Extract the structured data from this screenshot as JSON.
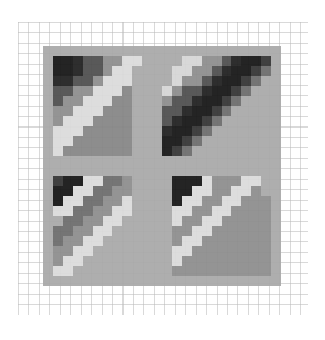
{
  "figure": {
    "kind": "heatmap-image",
    "background_color": "#ffffff",
    "grid_color": "#969696",
    "grid_cell_px": 10.45,
    "grid_rect": {
      "x": 18,
      "y": 22,
      "w": 290,
      "h": 293
    },
    "panel_rect": {
      "x": 43,
      "y": 46,
      "w": 238,
      "h": 240
    },
    "alpha": 0.93
  },
  "chart_data": {
    "type": "heatmap",
    "title": "",
    "xlabel": "",
    "ylabel": "",
    "colormap": "gray",
    "vmin": 0,
    "vmax": 1,
    "grid": true,
    "legend": "none",
    "nrows": 24,
    "ncols": 24,
    "xticklabels": [],
    "yticklabels": [],
    "values": [
      [
        0.66,
        0.66,
        0.66,
        0.66,
        0.66,
        0.66,
        0.66,
        0.66,
        0.66,
        0.66,
        0.66,
        0.66,
        0.66,
        0.66,
        0.66,
        0.66,
        0.66,
        0.66,
        0.66,
        0.66,
        0.66,
        0.66,
        0.66,
        0.66
      ],
      [
        0.66,
        0.08,
        0.08,
        0.12,
        0.3,
        0.3,
        0.55,
        0.55,
        0.86,
        0.86,
        0.66,
        0.66,
        0.66,
        0.66,
        0.84,
        0.84,
        0.55,
        0.55,
        0.3,
        0.12,
        0.08,
        0.08,
        0.2,
        0.66
      ],
      [
        0.66,
        0.08,
        0.08,
        0.12,
        0.3,
        0.3,
        0.55,
        0.86,
        0.86,
        0.66,
        0.66,
        0.66,
        0.66,
        0.84,
        0.84,
        0.55,
        0.55,
        0.3,
        0.12,
        0.08,
        0.08,
        0.2,
        0.42,
        0.66
      ],
      [
        0.66,
        0.12,
        0.12,
        0.3,
        0.3,
        0.55,
        0.86,
        0.86,
        0.86,
        0.66,
        0.66,
        0.66,
        0.66,
        0.84,
        0.55,
        0.55,
        0.3,
        0.12,
        0.08,
        0.08,
        0.2,
        0.42,
        0.66,
        0.66
      ],
      [
        0.66,
        0.3,
        0.3,
        0.55,
        0.55,
        0.86,
        0.86,
        0.86,
        0.52,
        0.66,
        0.66,
        0.66,
        0.84,
        0.55,
        0.3,
        0.3,
        0.12,
        0.08,
        0.08,
        0.2,
        0.42,
        0.66,
        0.66,
        0.66
      ],
      [
        0.66,
        0.3,
        0.55,
        0.55,
        0.86,
        0.86,
        0.86,
        0.52,
        0.52,
        0.66,
        0.66,
        0.66,
        0.55,
        0.3,
        0.3,
        0.12,
        0.08,
        0.08,
        0.2,
        0.42,
        0.66,
        0.66,
        0.66,
        0.66
      ],
      [
        0.66,
        0.55,
        0.55,
        0.86,
        0.86,
        0.86,
        0.52,
        0.52,
        0.52,
        0.66,
        0.66,
        0.66,
        0.3,
        0.3,
        0.12,
        0.08,
        0.08,
        0.2,
        0.42,
        0.66,
        0.66,
        0.66,
        0.66,
        0.66
      ],
      [
        0.66,
        0.55,
        0.86,
        0.86,
        0.86,
        0.52,
        0.52,
        0.52,
        0.52,
        0.66,
        0.66,
        0.66,
        0.3,
        0.12,
        0.08,
        0.08,
        0.2,
        0.42,
        0.66,
        0.66,
        0.66,
        0.66,
        0.66,
        0.66
      ],
      [
        0.66,
        0.86,
        0.86,
        0.86,
        0.52,
        0.52,
        0.52,
        0.52,
        0.52,
        0.66,
        0.66,
        0.66,
        0.12,
        0.08,
        0.08,
        0.2,
        0.42,
        0.66,
        0.66,
        0.66,
        0.66,
        0.66,
        0.66,
        0.66
      ],
      [
        0.66,
        0.86,
        0.86,
        0.52,
        0.52,
        0.52,
        0.52,
        0.52,
        0.52,
        0.66,
        0.66,
        0.66,
        0.08,
        0.08,
        0.2,
        0.42,
        0.66,
        0.66,
        0.66,
        0.66,
        0.66,
        0.66,
        0.66,
        0.66
      ],
      [
        0.66,
        0.86,
        0.52,
        0.52,
        0.52,
        0.52,
        0.52,
        0.52,
        0.52,
        0.66,
        0.66,
        0.66,
        0.08,
        0.2,
        0.42,
        0.66,
        0.66,
        0.66,
        0.66,
        0.66,
        0.66,
        0.66,
        0.66,
        0.66
      ],
      [
        0.66,
        0.66,
        0.66,
        0.66,
        0.66,
        0.66,
        0.66,
        0.66,
        0.66,
        0.66,
        0.66,
        0.66,
        0.66,
        0.66,
        0.66,
        0.66,
        0.66,
        0.66,
        0.66,
        0.66,
        0.66,
        0.66,
        0.66,
        0.66
      ],
      [
        0.66,
        0.66,
        0.66,
        0.66,
        0.66,
        0.66,
        0.66,
        0.66,
        0.66,
        0.66,
        0.66,
        0.66,
        0.66,
        0.66,
        0.66,
        0.66,
        0.66,
        0.66,
        0.66,
        0.66,
        0.66,
        0.66,
        0.66,
        0.66
      ],
      [
        0.66,
        0.2,
        0.08,
        0.08,
        0.86,
        0.86,
        0.42,
        0.42,
        0.55,
        0.66,
        0.66,
        0.66,
        0.66,
        0.08,
        0.08,
        0.08,
        0.86,
        0.55,
        0.55,
        0.55,
        0.86,
        0.86,
        0.66,
        0.66
      ],
      [
        0.66,
        0.08,
        0.08,
        0.86,
        0.86,
        0.42,
        0.42,
        0.55,
        0.55,
        0.66,
        0.66,
        0.66,
        0.66,
        0.08,
        0.08,
        0.86,
        0.86,
        0.55,
        0.55,
        0.86,
        0.86,
        0.55,
        0.66,
        0.66
      ],
      [
        0.66,
        0.08,
        0.86,
        0.86,
        0.42,
        0.42,
        0.55,
        0.55,
        0.86,
        0.66,
        0.66,
        0.66,
        0.66,
        0.08,
        0.86,
        0.86,
        0.55,
        0.55,
        0.86,
        0.86,
        0.55,
        0.55,
        0.55,
        0.66
      ],
      [
        0.66,
        0.86,
        0.86,
        0.42,
        0.42,
        0.55,
        0.55,
        0.86,
        0.86,
        0.66,
        0.66,
        0.66,
        0.66,
        0.86,
        0.86,
        0.55,
        0.55,
        0.86,
        0.86,
        0.55,
        0.55,
        0.55,
        0.55,
        0.66
      ],
      [
        0.66,
        0.66,
        0.42,
        0.42,
        0.55,
        0.55,
        0.86,
        0.86,
        0.66,
        0.66,
        0.66,
        0.66,
        0.66,
        0.86,
        0.55,
        0.55,
        0.86,
        0.86,
        0.55,
        0.55,
        0.55,
        0.55,
        0.55,
        0.66
      ],
      [
        0.66,
        0.42,
        0.42,
        0.55,
        0.55,
        0.86,
        0.86,
        0.66,
        0.66,
        0.66,
        0.66,
        0.66,
        0.66,
        0.55,
        0.55,
        0.86,
        0.86,
        0.55,
        0.55,
        0.55,
        0.55,
        0.55,
        0.55,
        0.66
      ],
      [
        0.66,
        0.42,
        0.55,
        0.55,
        0.86,
        0.86,
        0.66,
        0.66,
        0.66,
        0.66,
        0.66,
        0.66,
        0.66,
        0.55,
        0.86,
        0.86,
        0.55,
        0.55,
        0.55,
        0.55,
        0.55,
        0.55,
        0.55,
        0.66
      ],
      [
        0.66,
        0.55,
        0.55,
        0.86,
        0.86,
        0.66,
        0.66,
        0.66,
        0.66,
        0.66,
        0.66,
        0.66,
        0.66,
        0.86,
        0.86,
        0.55,
        0.55,
        0.55,
        0.55,
        0.55,
        0.55,
        0.55,
        0.55,
        0.66
      ],
      [
        0.66,
        0.55,
        0.86,
        0.86,
        0.66,
        0.66,
        0.66,
        0.66,
        0.66,
        0.66,
        0.66,
        0.66,
        0.66,
        0.86,
        0.55,
        0.55,
        0.55,
        0.55,
        0.55,
        0.55,
        0.55,
        0.55,
        0.55,
        0.66
      ],
      [
        0.66,
        0.86,
        0.86,
        0.66,
        0.66,
        0.66,
        0.66,
        0.66,
        0.66,
        0.66,
        0.66,
        0.66,
        0.66,
        0.55,
        0.55,
        0.55,
        0.55,
        0.55,
        0.55,
        0.55,
        0.55,
        0.55,
        0.55,
        0.66
      ],
      [
        0.66,
        0.66,
        0.66,
        0.66,
        0.66,
        0.66,
        0.66,
        0.66,
        0.66,
        0.66,
        0.66,
        0.66,
        0.66,
        0.66,
        0.66,
        0.66,
        0.66,
        0.66,
        0.66,
        0.66,
        0.66,
        0.66,
        0.66,
        0.66
      ]
    ]
  }
}
